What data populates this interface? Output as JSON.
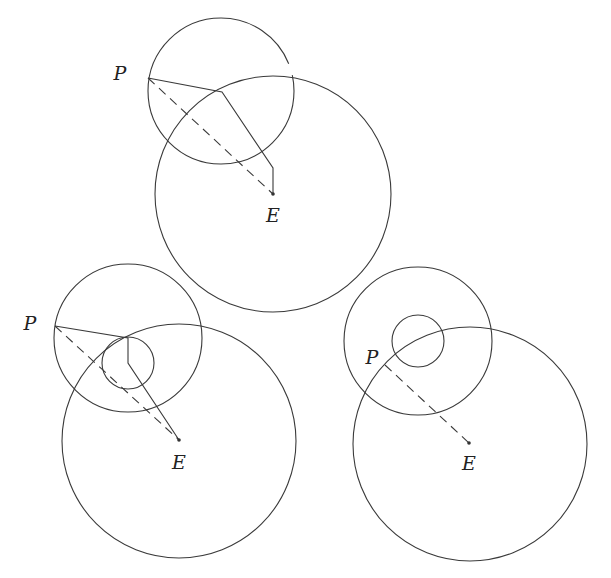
{
  "figure": {
    "panels": [
      {
        "id": "top",
        "labels": {
          "p": "P",
          "e": "E"
        },
        "p_label_pos": [
          120,
          80
        ],
        "e_label_pos": [
          273,
          222
        ],
        "point_p": [
          148,
          78
        ],
        "point_e": [
          273,
          194
        ],
        "circles": [
          {
            "cx": 221,
            "cy": 91,
            "r": 73
          },
          {
            "cx": 273,
            "cy": 194,
            "r": 118
          }
        ],
        "path": [
          [
            148,
            78
          ],
          [
            222,
            92
          ],
          [
            273,
            168
          ],
          [
            273,
            194
          ]
        ]
      },
      {
        "id": "bottom-left",
        "labels": {
          "p": "P",
          "e": "E"
        },
        "p_label_pos": [
          30,
          330
        ],
        "e_label_pos": [
          179,
          469
        ],
        "point_p": [
          55,
          326
        ],
        "point_e": [
          179,
          440
        ],
        "circles": [
          {
            "cx": 128,
            "cy": 338,
            "r": 74
          },
          {
            "cx": 128,
            "cy": 363,
            "r": 26
          },
          {
            "cx": 179,
            "cy": 441,
            "r": 117
          }
        ],
        "path": [
          [
            55,
            326
          ],
          [
            128,
            338
          ],
          [
            128,
            363
          ],
          [
            179,
            440
          ]
        ]
      },
      {
        "id": "bottom-right",
        "labels": {
          "p": "P",
          "e": "E"
        },
        "p_label_pos": [
          372,
          364
        ],
        "e_label_pos": [
          469,
          470
        ],
        "point_p": [
          385,
          365
        ],
        "point_e": [
          469,
          443
        ],
        "circles": [
          {
            "cx": 418,
            "cy": 341,
            "r": 74
          },
          {
            "cx": 418,
            "cy": 341,
            "r": 26
          },
          {
            "cx": 470,
            "cy": 444,
            "r": 117
          }
        ],
        "path": []
      }
    ]
  }
}
